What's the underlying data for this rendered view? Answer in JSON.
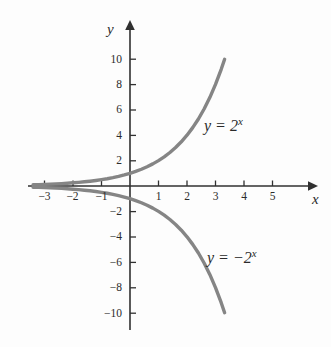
{
  "chart_data": {
    "type": "line",
    "title": "",
    "xlabel": "x",
    "ylabel": "y",
    "xlim": [
      -3.6,
      5.9
    ],
    "ylim": [
      -11.2,
      11.2
    ],
    "grid": false,
    "legend_position": "inline-annotation",
    "x_ticks": [
      -3,
      -2,
      -1,
      1,
      2,
      3,
      4,
      5
    ],
    "x_tick_labels": [
      "−3",
      "−2",
      "−1",
      "1",
      "2",
      "3",
      "4",
      "5"
    ],
    "y_ticks": [
      10,
      8,
      6,
      4,
      2,
      -2,
      -4,
      -6,
      -8,
      -10
    ],
    "y_tick_labels": [
      "10",
      "8",
      "6",
      "4",
      "2",
      "−2",
      "−4",
      "−6",
      "−8",
      "−10"
    ],
    "series": [
      {
        "name": "y = 2^x",
        "annotation": "y = 2ˣ",
        "color": "#858585",
        "x": [
          -3.4,
          -3.2,
          -3.0,
          -2.8,
          -2.6,
          -2.4,
          -2.2,
          -2.0,
          -1.8,
          -1.6,
          -1.4,
          -1.2,
          -1.0,
          -0.8,
          -0.6,
          -0.4,
          -0.2,
          0.0,
          0.2,
          0.4,
          0.6,
          0.8,
          1.0,
          1.2,
          1.4,
          1.6,
          1.8,
          2.0,
          2.2,
          2.4,
          2.6,
          2.8,
          3.0,
          3.2,
          3.32
        ],
        "values": [
          0.095,
          0.109,
          0.125,
          0.144,
          0.165,
          0.189,
          0.218,
          0.25,
          0.287,
          0.33,
          0.379,
          0.435,
          0.5,
          0.574,
          0.66,
          0.758,
          0.871,
          1.0,
          1.149,
          1.32,
          1.516,
          1.741,
          2.0,
          2.297,
          2.639,
          3.031,
          3.482,
          4.0,
          4.595,
          5.278,
          6.063,
          6.964,
          8.0,
          9.19,
          9.98
        ]
      },
      {
        "name": "y = -2^x",
        "annotation": "y = −2ˣ",
        "color": "#858585",
        "x": [
          -3.4,
          -3.2,
          -3.0,
          -2.8,
          -2.6,
          -2.4,
          -2.2,
          -2.0,
          -1.8,
          -1.6,
          -1.4,
          -1.2,
          -1.0,
          -0.8,
          -0.6,
          -0.4,
          -0.2,
          0.0,
          0.2,
          0.4,
          0.6,
          0.8,
          1.0,
          1.2,
          1.4,
          1.6,
          1.8,
          2.0,
          2.2,
          2.4,
          2.6,
          2.8,
          3.0,
          3.2,
          3.32
        ],
        "values": [
          -0.095,
          -0.109,
          -0.125,
          -0.144,
          -0.165,
          -0.189,
          -0.218,
          -0.25,
          -0.287,
          -0.33,
          -0.379,
          -0.435,
          -0.5,
          -0.574,
          -0.66,
          -0.758,
          -0.871,
          -1.0,
          -1.149,
          -1.32,
          -1.516,
          -1.741,
          -2.0,
          -2.297,
          -2.639,
          -3.031,
          -3.482,
          -4.0,
          -4.595,
          -5.278,
          -6.063,
          -6.964,
          -8.0,
          -9.19,
          -9.98
        ]
      }
    ]
  },
  "axes": {
    "x_axis_label": "x",
    "y_axis_label": "y"
  },
  "annotations": {
    "positive_curve": "y = 2",
    "positive_curve_exp": "x",
    "negative_curve": "y = −2",
    "negative_curve_exp": "x"
  },
  "colors": {
    "curve": "#858585",
    "axis": "#303030",
    "text": "#2b2b2b",
    "background": "#fdfdfd"
  }
}
